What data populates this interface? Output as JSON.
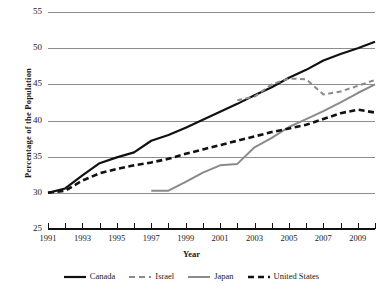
{
  "chart_data": {
    "type": "line",
    "title": "",
    "xlabel": "Year",
    "ylabel": "Percentage of the Population",
    "xlim": [
      1991,
      2010
    ],
    "ylim": [
      25,
      55
    ],
    "ytick_values": [
      25,
      30,
      35,
      40,
      45,
      50,
      55
    ],
    "ytick_labels": [
      "25",
      "30",
      "35",
      "40",
      "45",
      "50",
      "55"
    ],
    "xtick_values": [
      1991,
      1992,
      1993,
      1994,
      1995,
      1996,
      1997,
      1998,
      1999,
      2000,
      2001,
      2002,
      2003,
      2004,
      2005,
      2006,
      2007,
      2008,
      2009,
      2010
    ],
    "xtick_labels": [
      "1991",
      "",
      "1993",
      "",
      "1995",
      "",
      "1997",
      "",
      "1999",
      "",
      "2001",
      "",
      "2003",
      "",
      "2005",
      "",
      "2007",
      "",
      "2009",
      ""
    ],
    "grid": "horizontal",
    "legend_position": "bottom",
    "series": [
      {
        "name": "Canada",
        "color": "#111111",
        "style": "solid",
        "width": 2.2,
        "x": [
          1991,
          1992,
          1993,
          1994,
          1995,
          1996,
          1997,
          1998,
          1999,
          2000,
          2001,
          2002,
          2003,
          2004,
          2005,
          2006,
          2007,
          2008,
          2009,
          2010
        ],
        "values": [
          30.0,
          30.6,
          32.4,
          34.1,
          34.9,
          35.6,
          37.2,
          38.0,
          39.0,
          40.1,
          41.2,
          42.3,
          43.5,
          44.6,
          45.9,
          47.0,
          48.3,
          49.2,
          50.0,
          50.9
        ]
      },
      {
        "name": "Israel",
        "color": "#8a8a8a",
        "style": "dashed",
        "width": 2.0,
        "x": [
          2002,
          2003,
          2004,
          2005,
          2006,
          2007,
          2008,
          2009,
          2010
        ],
        "values": [
          42.8,
          43.3,
          45.0,
          45.8,
          45.7,
          43.6,
          44.0,
          44.8,
          45.6
        ]
      },
      {
        "name": "Japan",
        "color": "#8a8a8a",
        "style": "solid",
        "width": 2.0,
        "x": [
          1997,
          1998,
          1999,
          2000,
          2001,
          2002,
          2003,
          2004,
          2005,
          2006,
          2007,
          2008,
          2009,
          2010
        ],
        "values": [
          30.3,
          30.3,
          31.5,
          32.8,
          33.8,
          34.0,
          36.3,
          37.6,
          39.1,
          40.2,
          41.3,
          42.5,
          43.8,
          45.0
        ]
      },
      {
        "name": "United States",
        "color": "#111111",
        "style": "dashed",
        "width": 2.6,
        "x": [
          1991,
          1992,
          1993,
          1994,
          1995,
          1996,
          1997,
          1998,
          1999,
          2000,
          2001,
          2002,
          2003,
          2004,
          2005,
          2006,
          2007,
          2008,
          2009,
          2010
        ],
        "values": [
          30.0,
          30.3,
          31.7,
          32.7,
          33.3,
          33.8,
          34.2,
          34.7,
          35.4,
          36.0,
          36.6,
          37.2,
          37.8,
          38.4,
          38.9,
          39.4,
          40.2,
          41.0,
          41.5,
          41.1
        ]
      }
    ]
  }
}
